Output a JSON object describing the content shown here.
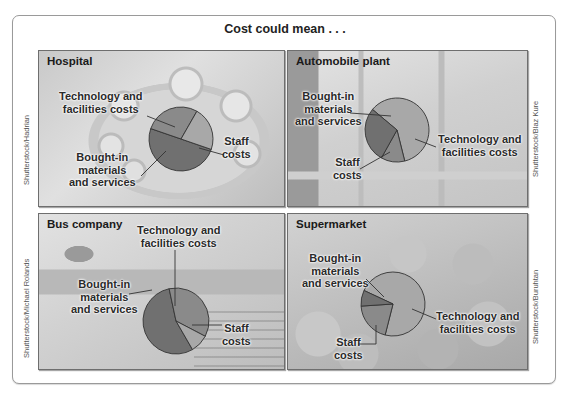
{
  "figure": {
    "title": "Cost could mean . . .",
    "colors": {
      "staff": "#707070",
      "technology": "#8a8a8a",
      "bought_in": "#a8a8a8",
      "outline": "#333333"
    }
  },
  "chart_data": [
    {
      "type": "pie",
      "title": "Hospital",
      "labels": [
        "Staff costs",
        "Technology and facilities costs",
        "Bought-in materials and services"
      ],
      "values": [
        50,
        28,
        22
      ],
      "credit": "Shutterstock/Hadrian"
    },
    {
      "type": "pie",
      "title": "Automobile plant",
      "labels": [
        "Bought-in materials and services",
        "Technology and facilities costs",
        "Staff costs"
      ],
      "values": [
        60,
        12,
        28
      ],
      "credit": "Shutterstock/Blaz Kure"
    },
    {
      "type": "pie",
      "title": "Bus company",
      "labels": [
        "Staff costs",
        "Technology and facilities costs",
        "Bought-in materials and services"
      ],
      "values": [
        55,
        36,
        9
      ],
      "credit": "Shutterstock/Michael Rolands"
    },
    {
      "type": "pie",
      "title": "Supermarket",
      "labels": [
        "Bought-in materials and services",
        "Technology and facilities costs",
        "Staff costs"
      ],
      "values": [
        72,
        20,
        8
      ],
      "credit": "Shutterstock/Buruhtan"
    }
  ],
  "labels": {
    "hospital": {
      "tech_1": "Technology and",
      "tech_2": "facilities costs",
      "bought_1": "Bought-in",
      "bought_2": "materials",
      "bought_3": "and services",
      "staff_1": "Staff",
      "staff_2": "costs"
    },
    "auto": {
      "tech_1": "Technology and",
      "tech_2": "facilities costs",
      "bought_1": "Bought-in",
      "bought_2": "materials",
      "bought_3": "and services",
      "staff_1": "Staff",
      "staff_2": "costs"
    },
    "bus": {
      "tech_1": "Technology and",
      "tech_2": "facilities costs",
      "bought_1": "Bought-in",
      "bought_2": "materials",
      "bought_3": "and services",
      "staff_1": "Staff",
      "staff_2": "costs"
    },
    "supermarket": {
      "tech_1": "Technology and",
      "tech_2": "facilities costs",
      "bought_1": "Bought-in",
      "bought_2": "materials",
      "bought_3": "and services",
      "staff_1": "Staff",
      "staff_2": "costs"
    }
  }
}
